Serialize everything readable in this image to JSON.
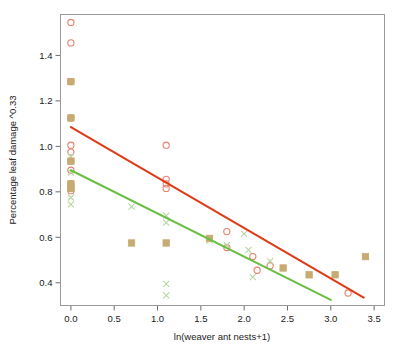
{
  "chart_data": {
    "type": "scatter",
    "title": "",
    "xlabel": "ln(weaver ant nests+1)",
    "ylabel": "Percentage leaf damage ^0.33",
    "xlim": [
      -0.12,
      3.62
    ],
    "ylim": [
      0.3,
      1.58
    ],
    "xticks": [
      "0.0",
      "0.5",
      "1.0",
      "1.5",
      "2.0",
      "2.5",
      "3.0",
      "3.5"
    ],
    "xtick_values": [
      0.0,
      0.5,
      1.0,
      1.5,
      2.0,
      2.5,
      3.0,
      3.5
    ],
    "yticks": [
      "0.4",
      "0.6",
      "0.8",
      "1.0",
      "1.2",
      "1.4"
    ],
    "ytick_values": [
      0.4,
      0.6,
      0.8,
      1.0,
      1.2,
      1.4
    ],
    "grid": false,
    "legend": "none",
    "colors": {
      "series_circle": "#e8806b",
      "series_cross": "#b7d6a0",
      "overlap_square": "#c6ab72",
      "regline_red": "#e03b18",
      "regline_green": "#6cbe45",
      "frame": "#9a9a9a",
      "text": "#1a1a1a"
    },
    "series": [
      {
        "name": "circle-open-markers",
        "marker": "circle",
        "color": "#e8806b",
        "points": [
          [
            0.0,
            1.545
          ],
          [
            0.0,
            1.455
          ],
          [
            0.0,
            1.285
          ],
          [
            0.0,
            1.125
          ],
          [
            0.0,
            1.005
          ],
          [
            0.0,
            0.975
          ],
          [
            0.0,
            0.935
          ],
          [
            0.0,
            0.895
          ],
          [
            0.0,
            0.835
          ],
          [
            0.0,
            0.815
          ],
          [
            0.0,
            0.805
          ],
          [
            1.1,
            1.005
          ],
          [
            1.1,
            0.855
          ],
          [
            1.1,
            0.835
          ],
          [
            1.1,
            0.815
          ],
          [
            1.8,
            0.625
          ],
          [
            1.8,
            0.555
          ],
          [
            2.1,
            0.515
          ],
          [
            2.3,
            0.475
          ],
          [
            2.15,
            0.455
          ],
          [
            3.2,
            0.355
          ]
        ]
      },
      {
        "name": "x-cross-markers",
        "marker": "cross",
        "color": "#b7d6a0",
        "points": [
          [
            0.0,
            0.955
          ],
          [
            0.0,
            0.885
          ],
          [
            0.0,
            0.775
          ],
          [
            0.0,
            0.745
          ],
          [
            0.7,
            0.735
          ],
          [
            1.1,
            0.695
          ],
          [
            1.1,
            0.665
          ],
          [
            1.1,
            0.395
          ],
          [
            1.1,
            0.345
          ],
          [
            1.6,
            0.585
          ],
          [
            1.8,
            0.565
          ],
          [
            2.0,
            0.615
          ],
          [
            2.05,
            0.545
          ],
          [
            2.3,
            0.495
          ],
          [
            2.1,
            0.425
          ]
        ]
      },
      {
        "name": "overlapping-filled-squares",
        "marker": "square",
        "color": "#c6ab72",
        "points": [
          [
            0.0,
            1.285
          ],
          [
            0.0,
            1.125
          ],
          [
            0.0,
            0.935
          ],
          [
            0.0,
            0.835
          ],
          [
            0.0,
            0.815
          ],
          [
            0.7,
            0.575
          ],
          [
            1.1,
            0.575
          ],
          [
            1.6,
            0.595
          ],
          [
            2.45,
            0.465
          ],
          [
            2.75,
            0.435
          ],
          [
            3.05,
            0.435
          ],
          [
            3.4,
            0.515
          ]
        ]
      }
    ],
    "trendlines": [
      {
        "name": "red-regression-line",
        "color": "#e03b18",
        "x_start": 0.0,
        "y_start": 1.085,
        "x_end": 3.38,
        "y_end": 0.335
      },
      {
        "name": "green-regression-line",
        "color": "#6cbe45",
        "x_start": 0.0,
        "y_start": 0.895,
        "x_end": 3.0,
        "y_end": 0.325
      }
    ]
  }
}
